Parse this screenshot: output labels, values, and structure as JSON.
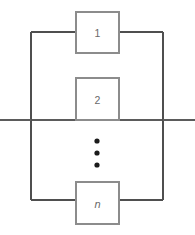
{
  "diagram": {
    "type": "parallel-reliability-block-diagram",
    "canvas": {
      "width": 195,
      "height": 235,
      "background": "#ffffff"
    },
    "colors": {
      "wire": "#5b5b5b",
      "rail": "#4f4f4f",
      "block_border": "#8c8c8c",
      "block_fill": "#ffffff",
      "label": "#6a6a6a",
      "dot": "#1b1b1b"
    },
    "rails": {
      "left_x": 31,
      "right_x": 163,
      "top_y": 32,
      "bottom_y": 200
    },
    "terminals": {
      "left": {
        "x1": 0,
        "x2": 31,
        "y": 120
      },
      "right": {
        "x1": 163,
        "x2": 195,
        "y": 120
      }
    },
    "blocks": [
      {
        "id": "block-1",
        "label": "1",
        "italic": false,
        "x": 76,
        "y": 12,
        "width": 43,
        "height": 41,
        "branch_y": 32
      },
      {
        "id": "block-2",
        "label": "2",
        "italic": false,
        "x": 76,
        "y": 78,
        "width": 43,
        "height": 42,
        "branch_y": 120
      },
      {
        "id": "block-n",
        "label": "n",
        "italic": true,
        "x": 76,
        "y": 182,
        "width": 43,
        "height": 42,
        "branch_y": 200
      }
    ],
    "ellipsis": {
      "label": "vertical-ellipsis",
      "cx": 97,
      "dots_y": [
        141,
        153,
        165
      ],
      "radius": 2.6
    }
  }
}
